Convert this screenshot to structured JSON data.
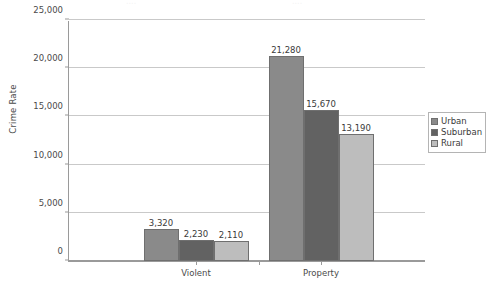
{
  "chart_data": {
    "type": "bar",
    "title": "",
    "xlabel": "",
    "ylabel": "Crime Rate",
    "categories": [
      "Violent",
      "Property"
    ],
    "series": [
      {
        "name": "Urban",
        "values": [
          3320,
          21280
        ],
        "color": "#8a8a8a"
      },
      {
        "name": "Suburban",
        "values": [
          2230,
          15670
        ],
        "color": "#626262"
      },
      {
        "name": "Rural",
        "values": [
          2110,
          13190
        ],
        "color": "#bdbdbd"
      }
    ],
    "value_labels": [
      [
        "3,320",
        "2,230",
        "2,110"
      ],
      [
        "21,280",
        "15,670",
        "13,190"
      ]
    ],
    "ylim": [
      0,
      25000
    ],
    "ytick_values": [
      0,
      5000,
      10000,
      15000,
      20000,
      25000
    ],
    "ytick_labels": [
      "0",
      "5,000",
      "10,000",
      "15,000",
      "20,000",
      "25,000"
    ],
    "grid": true,
    "legend_position": "right",
    "bar_border_color": "#6f6f6f",
    "axis_color": "#9a9a9a",
    "gridline_color": "#c9c9c9",
    "background": "#ffffff"
  },
  "artifact": {
    "fragment_left": "....",
    "fragment_right": "...."
  }
}
